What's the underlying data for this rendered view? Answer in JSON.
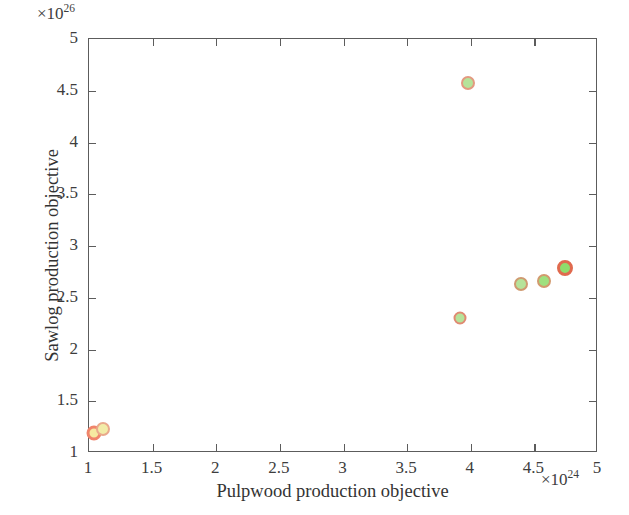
{
  "chart_data": {
    "type": "scatter",
    "title": "",
    "xlabel": "Pulpwood production objective",
    "ylabel": "Sawlog production objective",
    "x_exponent_prefix": "×10",
    "x_exponent_power": "24",
    "y_exponent_prefix": "×10",
    "y_exponent_power": "26",
    "xlim": [
      1,
      5
    ],
    "ylim": [
      1,
      5
    ],
    "xticks": [
      1,
      1.5,
      2,
      2.5,
      3,
      3.5,
      4,
      4.5,
      5
    ],
    "yticks": [
      1,
      1.5,
      2,
      2.5,
      3,
      3.5,
      4,
      4.5,
      5
    ],
    "xticklabels": [
      "1",
      "1.5",
      "2",
      "2.5",
      "3",
      "3.5",
      "4",
      "4.5",
      "5"
    ],
    "yticklabels": [
      "1",
      "1.5",
      "2",
      "2.5",
      "3",
      "3.5",
      "4",
      "4.5",
      "5"
    ],
    "grid": false,
    "legend": false,
    "marker_size_px": 13,
    "points": [
      {
        "x": 1.05,
        "y": 1.18,
        "fill": "#f6e9a0",
        "edge": "#f0846b",
        "edge_width": 3.2,
        "size": 15
      },
      {
        "x": 1.12,
        "y": 1.22,
        "fill": "#f2eca8",
        "edge": "#e9a98c",
        "edge_width": 2.6,
        "size": 14
      },
      {
        "x": 3.92,
        "y": 2.29,
        "fill": "#b6e39a",
        "edge": "#e08a72",
        "edge_width": 2.6,
        "size": 13
      },
      {
        "x": 4.4,
        "y": 2.62,
        "fill": "#b6e39a",
        "edge": "#cf9a70",
        "edge_width": 2.8,
        "size": 14
      },
      {
        "x": 4.58,
        "y": 2.65,
        "fill": "#9fe07f",
        "edge": "#d29a6e",
        "edge_width": 2.8,
        "size": 14
      },
      {
        "x": 4.75,
        "y": 2.78,
        "fill": "#8fdd6c",
        "edge": "#e06a4e",
        "edge_width": 3.4,
        "size": 16
      },
      {
        "x": 3.99,
        "y": 4.57,
        "fill": "#b6e39a",
        "edge": "#e39a80",
        "edge_width": 2.8,
        "size": 14
      }
    ]
  },
  "axes": {
    "box_color": "#5c5c5c",
    "tick_direction": "in"
  }
}
